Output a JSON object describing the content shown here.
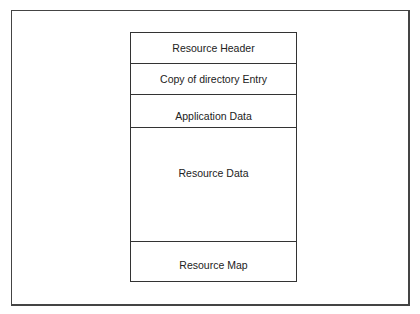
{
  "diagram": {
    "segments": [
      {
        "label": "Resource Header"
      },
      {
        "label": "Copy of directory Entry"
      },
      {
        "label": "Application Data"
      },
      {
        "label": "Resource Data"
      },
      {
        "label": "Resource Map"
      }
    ]
  }
}
